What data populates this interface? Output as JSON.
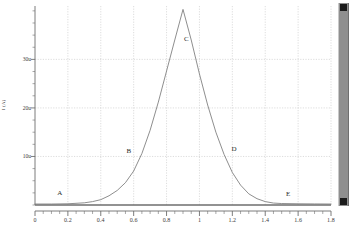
{
  "chart_data": {
    "type": "line",
    "title": "",
    "subtitle": "",
    "xlabel": "",
    "ylabel": "I (A)",
    "xlim": [
      0,
      1.8
    ],
    "ylim": [
      0,
      41
    ],
    "grid": true,
    "legend": "none",
    "xticks": [
      0,
      0.2,
      0.4,
      0.6,
      0.8,
      1,
      1.2,
      1.4,
      1.6,
      1.8
    ],
    "xtick_labels": [
      "0",
      "0.2",
      "0.4",
      "0.6",
      "0.8",
      "1",
      "1.2",
      "1.4",
      "1.6",
      "1.8"
    ],
    "yticks": [
      10,
      20,
      30
    ],
    "ytick_labels": [
      "10u",
      "20u",
      "30u"
    ],
    "y_unit": "u",
    "series": [
      {
        "name": "current",
        "color": "#7a7a7a",
        "x": [
          0,
          0.1,
          0.2,
          0.3,
          0.35,
          0.4,
          0.45,
          0.5,
          0.55,
          0.6,
          0.65,
          0.7,
          0.75,
          0.8,
          0.85,
          0.9,
          0.95,
          1.0,
          1.05,
          1.1,
          1.15,
          1.2,
          1.25,
          1.3,
          1.35,
          1.4,
          1.45,
          1.5,
          1.6,
          1.7,
          1.8
        ],
        "y": [
          0.2,
          0.2,
          0.25,
          0.45,
          0.7,
          1.1,
          1.9,
          3.0,
          4.6,
          7.0,
          10.6,
          15.4,
          21.2,
          27.6,
          34.0,
          40.3,
          34.0,
          27.0,
          20.6,
          15.0,
          10.4,
          6.7,
          4.1,
          2.3,
          1.3,
          0.7,
          0.4,
          0.3,
          0.25,
          0.22,
          0.2
        ]
      }
    ],
    "annotations": [
      {
        "text": "A",
        "x": 0.15,
        "y": 2.4
      },
      {
        "text": "B",
        "x": 0.57,
        "y": 11.2
      },
      {
        "text": "C",
        "x": 0.92,
        "y": 34.3
      },
      {
        "text": "D",
        "x": 1.21,
        "y": 11.6
      },
      {
        "text": "E",
        "x": 1.54,
        "y": 2.2
      }
    ]
  },
  "figure": {
    "caption": "",
    "background_color": "#ffffff",
    "axis_color": "#6e6e6e",
    "grid_color": "#c6c6c6",
    "curve_color": "#7a7a7a"
  },
  "scrollbar": {
    "orientation": "vertical",
    "track_color": "#8f8f8f",
    "thumb_color": "#1b1b1b"
  }
}
